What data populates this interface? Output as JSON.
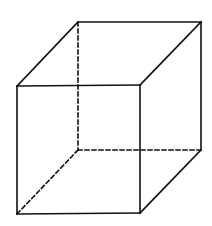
{
  "diagram": {
    "title": "",
    "type": "wireframe-cube",
    "stroke_color": "#111111",
    "background": "#ffffff",
    "stroke_width": 1.6,
    "dash_pattern": "4 3",
    "vertices": {
      "front_top_left": [
        17,
        86
      ],
      "front_top_right": [
        140,
        85
      ],
      "front_bottom_left": [
        17,
        214
      ],
      "front_bottom_right": [
        140,
        213
      ],
      "back_top_left": [
        78,
        22
      ],
      "back_top_right": [
        201,
        22
      ],
      "back_bottom_left": [
        78,
        150
      ],
      "back_bottom_right": [
        201,
        150
      ]
    },
    "solid_edges": [
      [
        "front_top_left",
        "front_top_right"
      ],
      [
        "front_top_right",
        "front_bottom_right"
      ],
      [
        "front_bottom_right",
        "front_bottom_left"
      ],
      [
        "front_bottom_left",
        "front_top_left"
      ],
      [
        "front_top_left",
        "back_top_left"
      ],
      [
        "back_top_left",
        "back_top_right"
      ],
      [
        "back_top_right",
        "front_top_right"
      ],
      [
        "back_top_right",
        "back_bottom_right"
      ],
      [
        "back_bottom_right",
        "front_bottom_right"
      ]
    ],
    "hidden_edges": [
      [
        "back_top_left",
        "back_bottom_left"
      ],
      [
        "back_bottom_left",
        "back_bottom_right"
      ],
      [
        "back_bottom_left",
        "front_bottom_left"
      ]
    ]
  }
}
